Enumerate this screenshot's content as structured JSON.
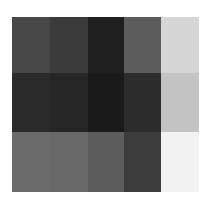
{
  "grid": {
    "rows": 3,
    "cols": 5,
    "col_edges": [
      0,
      38,
      76,
      112,
      149,
      187
    ],
    "row_edges": [
      0,
      56,
      115,
      175
    ],
    "cells": [
      [
        "#474747",
        "#3b3b3b",
        "#1f1f1f",
        "#5c5c5c",
        "#d6d6d6"
      ],
      [
        "#2a2a2a",
        "#262626",
        "#1a1a1a",
        "#2c2c2c",
        "#c4c4c4"
      ],
      [
        "#6b6b6b",
        "#686868",
        "#5c5c5c",
        "#3c3c3c",
        "#f2f2f2"
      ]
    ]
  }
}
